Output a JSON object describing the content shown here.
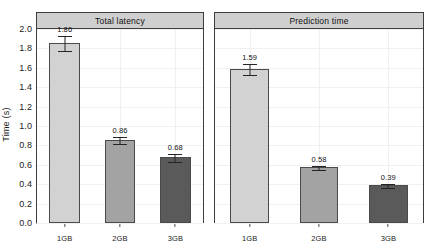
{
  "chart_data": {
    "type": "bar",
    "title": "",
    "xlabel": "",
    "ylabel": "Time (s)",
    "ylim": [
      0.0,
      2.0
    ],
    "ytick_labels": [
      "0.0",
      "0.2",
      "0.4",
      "0.6",
      "0.8",
      "1.0",
      "1.2",
      "1.4",
      "1.6",
      "1.8",
      "2.0"
    ],
    "ytick_values": [
      0.0,
      0.2,
      0.4,
      0.6,
      0.8,
      1.0,
      1.2,
      1.4,
      1.6,
      1.8,
      2.0
    ],
    "categories": [
      "1GB",
      "2GB",
      "3GB"
    ],
    "grid": true,
    "legend": "none",
    "panels": [
      {
        "strip_label": "Total latency",
        "values": [
          1.86,
          0.86,
          0.68
        ],
        "value_labels": [
          "1.86",
          "0.86",
          "0.68"
        ],
        "errors": [
          0.075,
          0.035,
          0.045
        ],
        "bar_colors": [
          "#d2d2d2",
          "#a3a3a3",
          "#5a5a5a"
        ]
      },
      {
        "strip_label": "Prediction time",
        "values": [
          1.59,
          0.58,
          0.39
        ],
        "value_labels": [
          "1.59",
          "0.58",
          "0.39"
        ],
        "errors": [
          0.055,
          0.022,
          0.018
        ],
        "bar_colors": [
          "#d2d2d2",
          "#a3a3a3",
          "#5a5a5a"
        ]
      }
    ]
  }
}
